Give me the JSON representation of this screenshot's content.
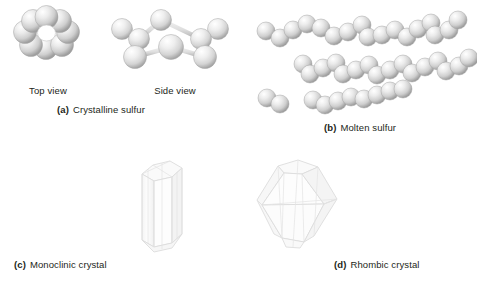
{
  "figure": {
    "background_color": "#ffffff",
    "width": 477,
    "height": 286
  },
  "palette": {
    "sphere_light": "#fbfbfb",
    "sphere_mid": "#d9d9d9",
    "sphere_dark": "#9a9a9a",
    "sphere_outline": "#8c8c8c",
    "bond_light": "#e6e6e6",
    "bond_dark": "#a8a8a8",
    "crystal_fill": "#fcfcfc",
    "crystal_edge": "#d2d2d2",
    "text_color": "#231f20"
  },
  "panels": [
    {
      "id": "a",
      "tag": "(a)",
      "caption": "Crystalline sulfur",
      "molecule": "S8 ring",
      "views": [
        {
          "name": "top-view",
          "label": "Top view",
          "atom_count": 8
        },
        {
          "name": "side-view",
          "label": "Side view",
          "atom_count": 8
        }
      ]
    },
    {
      "id": "b",
      "tag": "(b)",
      "caption": "Molten sulfur",
      "molecule": "open sulfur chains",
      "chains": [
        {
          "name": "chain-top",
          "atom_count": 17
        },
        {
          "name": "chain-middle",
          "atom_count": 16
        },
        {
          "name": "chain-bottom-fragment",
          "atom_count": 2
        },
        {
          "name": "chain-bottom",
          "atom_count": 8
        }
      ]
    },
    {
      "id": "c",
      "tag": "(c)",
      "caption": "Monoclinic crystal",
      "shape": "elongated needle-like prism"
    },
    {
      "id": "d",
      "tag": "(d)",
      "caption": "Rhombic crystal",
      "shape": "bipyramidal octahedral crystal"
    }
  ],
  "labels": {
    "top_view": "Top view",
    "side_view": "Side view",
    "caption_a_tag": "(a)",
    "caption_a_text": "Crystalline sulfur",
    "caption_b_tag": "(b)",
    "caption_b_text": "Molten sulfur",
    "caption_c_tag": "(c)",
    "caption_c_text": "Monoclinic crystal",
    "caption_d_tag": "(d)",
    "caption_d_text": "Rhombic crystal"
  }
}
